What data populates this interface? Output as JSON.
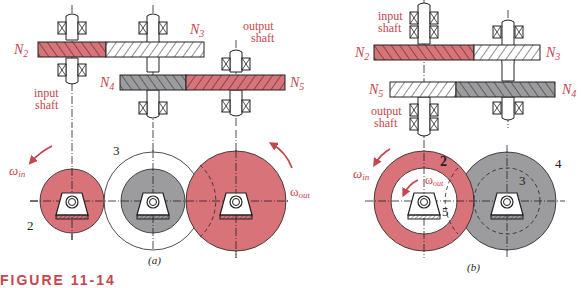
{
  "figure": {
    "caption": "FIGURE 11-14",
    "colors": {
      "red": "#d8737a",
      "gray": "#9c9c9e",
      "label_red": "#c4464f",
      "line": "#222222"
    },
    "panel_a": {
      "sublabel": "(a)",
      "labels": {
        "n2": "N",
        "n2_sub": "2",
        "n3": "N",
        "n3_sub": "3",
        "n4": "N",
        "n4_sub": "4",
        "n5": "N",
        "n5_sub": "5",
        "input_shaft_1": "input",
        "input_shaft_2": "shaft",
        "output_shaft_1": "output",
        "output_shaft_2": "shaft",
        "omega_in": "ω",
        "omega_in_sub": "in",
        "omega_out": "ω",
        "omega_out_sub": "out",
        "gear_2": "2",
        "gear_3": "3"
      }
    },
    "panel_b": {
      "sublabel": "(b)",
      "labels": {
        "n2": "N",
        "n2_sub": "2",
        "n3": "N",
        "n3_sub": "3",
        "n4": "N",
        "n4_sub": "4",
        "n5": "N",
        "n5_sub": "5",
        "input_shaft_1": "input",
        "input_shaft_2": "shaft",
        "output_shaft_1": "output",
        "output_shaft_2": "shaft",
        "omega_in": "ω",
        "omega_in_sub": "in",
        "omega_out": "ω",
        "omega_out_sub": "out",
        "gear_2": "2",
        "gear_3": "3",
        "gear_4": "4",
        "gear_5": "5"
      }
    }
  }
}
